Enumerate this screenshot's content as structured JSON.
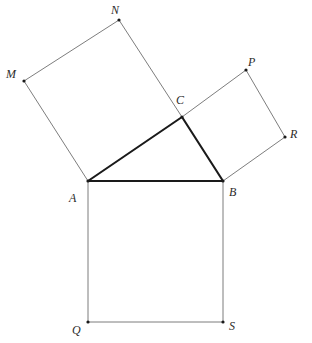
{
  "figure": {
    "background_color": "#ffffff",
    "width": 312,
    "height": 343,
    "stroke_thin_color": "#6e6e6e",
    "stroke_bold_color": "#1a1a1a",
    "stroke_thin_width": 0.9,
    "stroke_bold_width": 2.1,
    "vertex_dot_color": "#1a1a1a",
    "vertex_dot_radius": 1.6
  },
  "points": {
    "A": {
      "label": "A",
      "x": 88,
      "y": 181,
      "label_x": 69,
      "label_y": 192,
      "dot": true
    },
    "B": {
      "label": "B",
      "x": 223,
      "y": 181,
      "label_x": 229,
      "label_y": 186,
      "dot": true
    },
    "C": {
      "label": "C",
      "x": 182,
      "y": 117,
      "label_x": 176,
      "label_y": 94,
      "dot": true
    },
    "M": {
      "label": "M",
      "x": 24,
      "y": 81,
      "label_x": 6,
      "label_y": 68,
      "dot": true
    },
    "N": {
      "label": "N",
      "x": 119,
      "y": 20,
      "label_x": 111,
      "label_y": 4,
      "dot": true
    },
    "P": {
      "label": "P",
      "x": 246,
      "y": 70,
      "label_x": 248,
      "label_y": 56,
      "dot": true
    },
    "R": {
      "label": "R",
      "x": 285,
      "y": 137,
      "label_x": 290,
      "label_y": 128,
      "dot": true
    },
    "Q": {
      "label": "Q",
      "x": 88,
      "y": 322,
      "label_x": 72,
      "label_y": 324,
      "dot": true
    },
    "S": {
      "label": "S",
      "x": 223,
      "y": 322,
      "label_x": 229,
      "label_y": 320,
      "dot": true
    }
  },
  "shapes": {
    "triangle": {
      "name": "triangle-abc",
      "vertices": [
        "A",
        "C",
        "B"
      ],
      "polygon_points": "88,181 182,117 223,181",
      "emphasis": "bold"
    },
    "square_on_ac": {
      "name": "square-acnm",
      "vertices": [
        "A",
        "C",
        "N",
        "M"
      ],
      "polygon_points": "88,181 182,117 119,20 24,81",
      "emphasis": "thin"
    },
    "square_on_cb": {
      "name": "square-cprb",
      "vertices": [
        "C",
        "P",
        "R",
        "B"
      ],
      "polygon_points": "182,117 246,70 285,137 223,181",
      "emphasis": "thin"
    },
    "square_on_ab": {
      "name": "square-abqs",
      "vertices": [
        "A",
        "B",
        "S",
        "Q"
      ],
      "polygon_points": "88,181 223,181 223,322 88,322",
      "emphasis": "thin"
    }
  },
  "bold_segments": [
    {
      "name": "segment-ab",
      "from": "A",
      "to": "B",
      "x1": 88,
      "y1": 181,
      "x2": 223,
      "y2": 181
    },
    {
      "name": "segment-ac",
      "from": "A",
      "to": "C",
      "x1": 88,
      "y1": 181,
      "x2": 182,
      "y2": 117
    },
    {
      "name": "segment-cb",
      "from": "C",
      "to": "B",
      "x1": 182,
      "y1": 117,
      "x2": 223,
      "y2": 181
    }
  ],
  "thin_segments": [
    {
      "name": "segment-cn",
      "from": "C",
      "to": "N",
      "x1": 182,
      "y1": 117,
      "x2": 119,
      "y2": 20
    },
    {
      "name": "segment-nm",
      "from": "N",
      "to": "M",
      "x1": 119,
      "y1": 20,
      "x2": 24,
      "y2": 81
    },
    {
      "name": "segment-ma",
      "from": "M",
      "to": "A",
      "x1": 24,
      "y1": 81,
      "x2": 88,
      "y2": 181
    },
    {
      "name": "segment-cp",
      "from": "C",
      "to": "P",
      "x1": 182,
      "y1": 117,
      "x2": 246,
      "y2": 70
    },
    {
      "name": "segment-pr",
      "from": "P",
      "to": "R",
      "x1": 246,
      "y1": 70,
      "x2": 285,
      "y2": 137
    },
    {
      "name": "segment-rb",
      "from": "R",
      "to": "B",
      "x1": 285,
      "y1": 137,
      "x2": 223,
      "y2": 181
    },
    {
      "name": "segment-bs",
      "from": "B",
      "to": "S",
      "x1": 223,
      "y1": 181,
      "x2": 223,
      "y2": 322
    },
    {
      "name": "segment-sq",
      "from": "S",
      "to": "Q",
      "x1": 223,
      "y1": 322,
      "x2": 88,
      "y2": 322
    },
    {
      "name": "segment-qa",
      "from": "Q",
      "to": "A",
      "x1": 88,
      "y1": 322,
      "x2": 88,
      "y2": 181
    }
  ]
}
